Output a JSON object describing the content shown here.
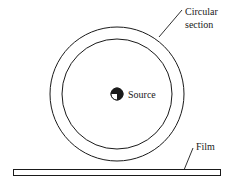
{
  "diagram": {
    "labels": {
      "circular_section_line1": "Circular",
      "circular_section_line2": "section",
      "source": "Source",
      "film": "Film"
    },
    "colors": {
      "stroke": "#1a1a1a",
      "background": "#ffffff"
    }
  }
}
